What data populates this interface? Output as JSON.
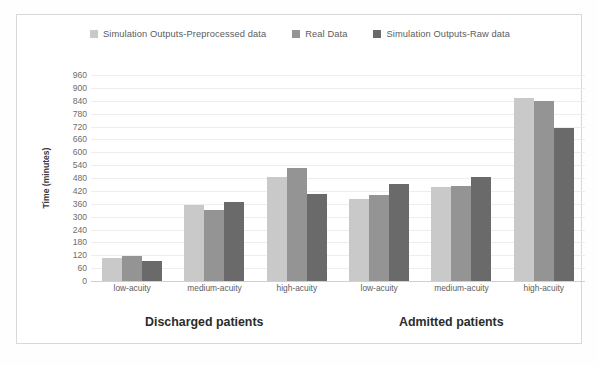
{
  "chart_data": {
    "type": "bar",
    "title": "",
    "xlabel": "",
    "ylabel": "Time (minutes)",
    "ylim": [
      0,
      960
    ],
    "ytick_step": 60,
    "yticks": [
      960,
      900,
      840,
      780,
      720,
      660,
      600,
      540,
      480,
      420,
      360,
      300,
      240,
      180,
      120,
      60,
      0
    ],
    "grid": true,
    "legend_position": "top-center",
    "categories": [
      "low-acuity",
      "medium-acuity",
      "high-acuity",
      "low-acuity",
      "medium-acuity",
      "high-acuity"
    ],
    "group_sections": [
      {
        "label": "Discharged patients",
        "categories": [
          "low-acuity",
          "medium-acuity",
          "high-acuity"
        ]
      },
      {
        "label": "Admitted patients",
        "categories": [
          "low-acuity",
          "medium-acuity",
          "high-acuity"
        ]
      }
    ],
    "series": [
      {
        "name": "Simulation Outputs-Preprocessed data",
        "color": "#c9c9c9",
        "values": [
          105,
          355,
          485,
          380,
          440,
          855
        ]
      },
      {
        "name": "Real Data",
        "color": "#949494",
        "values": [
          115,
          330,
          525,
          400,
          445,
          838
        ]
      },
      {
        "name": "Simulation Outputs-Raw data",
        "color": "#6a6a6a",
        "values": [
          95,
          370,
          405,
          450,
          485,
          715
        ]
      }
    ]
  },
  "legend": {
    "items": [
      {
        "label": "Simulation Outputs-Preprocessed data",
        "color": "#c9c9c9"
      },
      {
        "label": "Real Data",
        "color": "#949494"
      },
      {
        "label": "Simulation Outputs-Raw data",
        "color": "#6a6a6a"
      }
    ]
  },
  "axis": {
    "y_title": "Time (minutes)"
  }
}
